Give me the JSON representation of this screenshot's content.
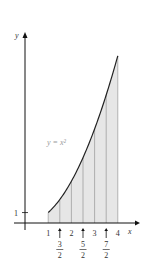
{
  "chart_data": {
    "type": "area",
    "title": "",
    "function_label": "y = x²",
    "function": "x^2",
    "xlabel": "x",
    "ylabel": "y",
    "shaded_interval": [
      1,
      4
    ],
    "partition": [
      1,
      1.5,
      2,
      2.5,
      3,
      3.5,
      4
    ],
    "x_tick_labels": [
      {
        "x": 1,
        "label": "1",
        "arrow": false
      },
      {
        "x": 1.5,
        "num": "3",
        "den": "2",
        "arrow": true
      },
      {
        "x": 2,
        "label": "2",
        "arrow": false
      },
      {
        "x": 2.5,
        "num": "5",
        "den": "2",
        "arrow": true
      },
      {
        "x": 3,
        "label": "3",
        "arrow": false
      },
      {
        "x": 3.5,
        "num": "7",
        "den": "2",
        "arrow": true
      },
      {
        "x": 4,
        "label": "4",
        "arrow": false
      }
    ],
    "y_tick_labels": [
      {
        "y": 1,
        "label": "1"
      }
    ],
    "xlim": [
      -0.5,
      4.5
    ],
    "ylim": [
      0,
      16
    ],
    "grid": false,
    "colors": {
      "fill": "#e6e6e6",
      "curve": "#222222",
      "axis": "#111111",
      "strip_lines": "#888888"
    }
  }
}
